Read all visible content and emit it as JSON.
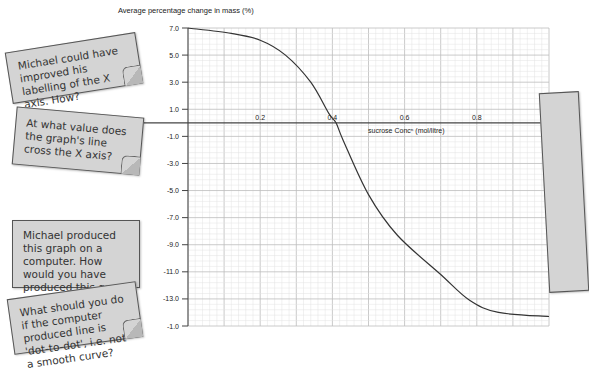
{
  "notes": [
    {
      "text": "Michael could have improved his labelling of the X axis. How?"
    },
    {
      "text": "At what value does the graph's line cross the X axis?"
    },
    {
      "text": "Michael produced this graph on a computer. How would you have produced this graph using a computer?"
    },
    {
      "text": "What should you do if the computer produced line is 'dot-to-dot', i.e. not a smooth curve?"
    }
  ],
  "chart_data": {
    "type": "line",
    "title": "",
    "ylabel": "Average percentage change in mass (%)",
    "xlabel": "sucrose Concⁿ (mol/litre)",
    "x_tick_labels": [
      "0.2",
      "0.4",
      "0.6",
      "0.8",
      "1"
    ],
    "x_ticks": [
      0.2,
      0.4,
      0.6,
      0.8,
      1.0
    ],
    "y_tick_labels": [
      "7.0",
      "5.0",
      "3.0",
      "1.0",
      "-1.0",
      "-3.0",
      "-5.0",
      "-7.0",
      "-9.0",
      "-11.0",
      "-13.0",
      "-1.0"
    ],
    "y_ticks": [
      7,
      5,
      3,
      1,
      -1,
      -3,
      -5,
      -7,
      -9,
      -11,
      -13,
      -15
    ],
    "xlim": [
      0,
      1.0
    ],
    "ylim": [
      -15,
      7
    ],
    "grid": true,
    "series": [
      {
        "name": "Average percentage change in mass",
        "x": [
          0.0,
          0.12,
          0.2,
          0.27,
          0.34,
          0.39,
          0.41,
          0.43,
          0.5,
          0.58,
          0.7,
          0.78,
          0.86,
          1.0
        ],
        "y": [
          7.0,
          6.6,
          6.1,
          5.0,
          3.0,
          0.7,
          0.0,
          -1.3,
          -5.3,
          -8.3,
          -11.2,
          -13.1,
          -14.0,
          -14.3
        ]
      }
    ]
  }
}
